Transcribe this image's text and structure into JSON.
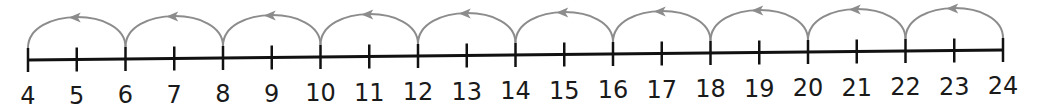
{
  "number_line": {
    "start": 4,
    "end": 24,
    "step": 1,
    "labels": [
      "4",
      "5",
      "6",
      "7",
      "8",
      "9",
      "10",
      "11",
      "12",
      "13",
      "14",
      "15",
      "16",
      "17",
      "18",
      "19",
      "20",
      "21",
      "22",
      "23",
      "24"
    ],
    "line_color": "#111111",
    "arc_color": "#8c8c8c"
  },
  "jumps": {
    "direction": "backward",
    "size": 2,
    "arcs": [
      {
        "from": 6,
        "to": 4
      },
      {
        "from": 8,
        "to": 6
      },
      {
        "from": 10,
        "to": 8
      },
      {
        "from": 12,
        "to": 10
      },
      {
        "from": 14,
        "to": 12
      },
      {
        "from": 16,
        "to": 14
      },
      {
        "from": 18,
        "to": 16
      },
      {
        "from": 20,
        "to": 18
      },
      {
        "from": 22,
        "to": 20
      },
      {
        "from": 24,
        "to": 22
      }
    ]
  }
}
